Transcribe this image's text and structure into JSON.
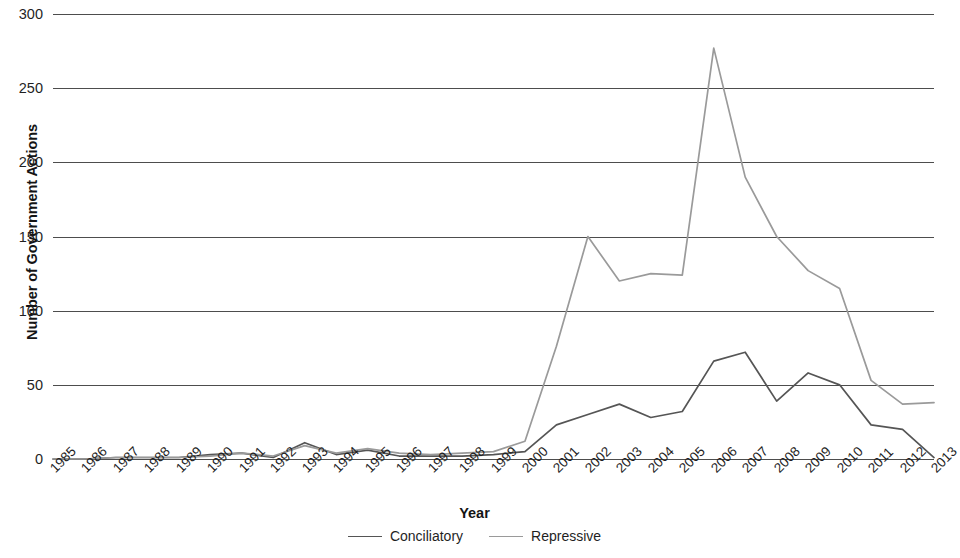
{
  "chart_data": {
    "type": "line",
    "title": "",
    "xlabel": "Year",
    "ylabel": "Number of Government Actions",
    "ylim": [
      0,
      300
    ],
    "yticks": [
      0,
      50,
      100,
      150,
      200,
      250,
      300
    ],
    "grid": true,
    "legend_position": "bottom",
    "x": [
      "1985",
      "1986",
      "1987",
      "1988",
      "1989",
      "1990",
      "1991",
      "1992",
      "1993",
      "1994",
      "1995",
      "1996",
      "1997",
      "1998",
      "1999",
      "2000",
      "2001",
      "2002",
      "2003",
      "2004",
      "2005",
      "2006",
      "2007",
      "2008",
      "2009",
      "2010",
      "2011",
      "2012",
      "2013"
    ],
    "series": [
      {
        "name": "Conciliatory",
        "color": "#555555",
        "values": [
          0,
          0,
          1,
          1,
          1,
          3,
          4,
          1,
          11,
          3,
          6,
          2,
          2,
          2,
          3,
          5,
          23,
          30,
          37,
          28,
          32,
          66,
          72,
          39,
          58,
          50,
          23,
          20,
          1
        ]
      },
      {
        "name": "Repressive",
        "color": "#9a9a9a",
        "values": [
          0,
          0,
          1,
          1,
          1,
          2,
          4,
          2,
          9,
          4,
          7,
          4,
          3,
          4,
          5,
          12,
          76,
          150,
          120,
          125,
          124,
          277,
          190,
          150,
          127,
          115,
          53,
          37,
          38
        ]
      }
    ]
  },
  "axes": {
    "y_title": "Number of Government Actions",
    "x_title": "Year",
    "y_tick_labels": [
      "300",
      "250",
      "200",
      "150",
      "100",
      "50",
      "0"
    ]
  },
  "legend": {
    "items": [
      {
        "label": "Conciliatory",
        "color": "#555555"
      },
      {
        "label": "Repressive",
        "color": "#9a9a9a"
      }
    ]
  }
}
